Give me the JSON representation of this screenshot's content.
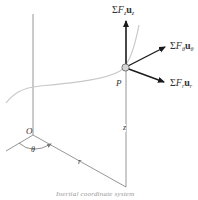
{
  "diagram": {
    "caption": "Inertial coordinate system",
    "colors": {
      "axis": "#8a8a8a",
      "vector": "#1a1a1a",
      "path": "#c8c8c8",
      "particle_fill": "#d6d6d6",
      "particle_stroke": "#6a6a6a",
      "text": "#333333"
    },
    "labels": {
      "origin": "O",
      "particle": "P",
      "angle": "θ",
      "radial": "r",
      "height": "z"
    },
    "vectors": [
      {
        "id": "z",
        "sigma": "Σ",
        "force": "F",
        "force_sub": "z",
        "unit": "u",
        "unit_sub": "z"
      },
      {
        "id": "theta",
        "sigma": "Σ",
        "force": "F",
        "force_sub": "θ",
        "unit": "u",
        "unit_sub": "θ"
      },
      {
        "id": "r",
        "sigma": "Σ",
        "force": "F",
        "force_sub": "r",
        "unit": "u",
        "unit_sub": "r"
      }
    ]
  }
}
